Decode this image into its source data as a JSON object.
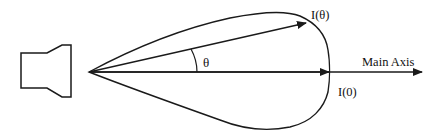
{
  "diagram": {
    "labels": {
      "intensity_theta": "I(θ)",
      "intensity_zero": "I(0)",
      "main_axis": "Main Axis",
      "angle": "θ"
    },
    "elements": {
      "source": "speaker-horn",
      "lobe": "radiation-pattern-lobe"
    },
    "colors": {
      "stroke": "#1a1a1a",
      "background": "#ffffff"
    }
  }
}
